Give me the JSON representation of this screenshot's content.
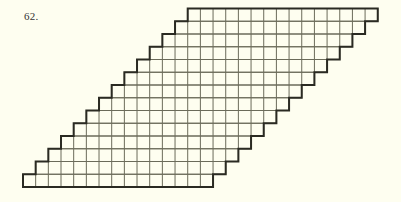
{
  "figure": {
    "label": "62.",
    "grid": {
      "rows": 14,
      "cols_per_row": 15,
      "shift_per_row_cells": 1,
      "shift_direction": "right going up",
      "origin_bottom_left": [
        23,
        187
      ],
      "cell_width": 12.67,
      "cell_height": 12.75
    },
    "colors": {
      "background": "#fefef0",
      "inner_line": "#6b6b5a",
      "outline": "#2a2a22"
    }
  }
}
